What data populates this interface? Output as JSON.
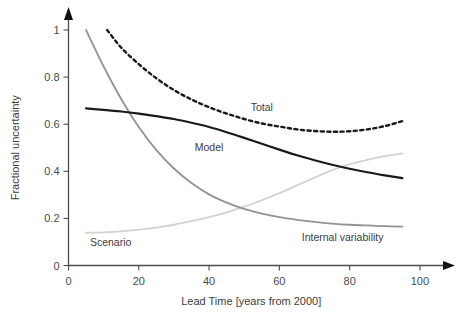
{
  "chart_data": {
    "type": "line",
    "title": "",
    "subtitle": "",
    "xlabel": "Lead Time [years from 2000]",
    "ylabel": "Fractional uncertainty",
    "xlim": [
      0,
      104
    ],
    "ylim": [
      0,
      1.08
    ],
    "grid": false,
    "legend_position": "inline-annotations",
    "xticks": [
      0,
      20,
      40,
      60,
      80,
      100
    ],
    "xtick_labels": [
      "0",
      "20",
      "40",
      "60",
      "80",
      "100"
    ],
    "yticks": [
      0,
      0.2,
      0.4,
      0.6,
      0.8,
      1
    ],
    "ytick_labels": [
      "0",
      "0.2",
      "0.4",
      "0.6",
      "0.8",
      "1"
    ],
    "x": [
      5,
      10,
      15,
      20,
      25,
      30,
      35,
      40,
      45,
      50,
      55,
      60,
      65,
      70,
      75,
      80,
      85,
      90,
      95
    ],
    "series": [
      {
        "name": "Total",
        "label": "Total",
        "color": "#1a1a1a",
        "style": "dashed",
        "width": 2.4,
        "x": [
          11,
          15,
          20,
          25,
          30,
          35,
          40,
          45,
          50,
          55,
          60,
          65,
          70,
          75,
          80,
          85,
          90,
          95
        ],
        "values": [
          1.0,
          0.925,
          0.855,
          0.795,
          0.745,
          0.705,
          0.672,
          0.645,
          0.622,
          0.603,
          0.59,
          0.578,
          0.571,
          0.568,
          0.57,
          0.578,
          0.592,
          0.613
        ],
        "label_x": 55,
        "label_y": 0.672
      },
      {
        "name": "Model",
        "label": "Model",
        "color": "#1a1a1a",
        "style": "solid",
        "width": 2.2,
        "x": [
          5,
          10,
          15,
          20,
          25,
          30,
          35,
          40,
          45,
          50,
          55,
          60,
          65,
          70,
          75,
          80,
          85,
          90,
          95
        ],
        "values": [
          0.667,
          0.661,
          0.654,
          0.645,
          0.634,
          0.622,
          0.606,
          0.588,
          0.566,
          0.542,
          0.517,
          0.492,
          0.468,
          0.447,
          0.428,
          0.411,
          0.396,
          0.383,
          0.371
        ],
        "label_x": 40,
        "label_y": 0.505
      },
      {
        "name": "Scenario",
        "label": "Scenario",
        "color": "#939393",
        "style": "solid",
        "width": 1.8,
        "x": [
          5,
          10,
          15,
          20,
          25,
          30,
          35,
          40,
          45,
          50,
          55,
          60,
          65,
          70,
          75,
          80,
          85,
          90,
          95
        ],
        "values": [
          1.0,
          0.845,
          0.707,
          0.588,
          0.49,
          0.412,
          0.35,
          0.302,
          0.267,
          0.24,
          0.22,
          0.205,
          0.194,
          0.185,
          0.178,
          0.173,
          0.17,
          0.167,
          0.165
        ],
        "label_x": 12,
        "label_y": 0.098
      },
      {
        "name": "Internal variability",
        "label": "Internal variability",
        "color": "#d2d2d2",
        "style": "solid",
        "width": 1.8,
        "x": [
          5,
          10,
          15,
          20,
          25,
          30,
          35,
          40,
          45,
          50,
          55,
          60,
          65,
          70,
          75,
          80,
          85,
          90,
          95
        ],
        "values": [
          0.139,
          0.141,
          0.145,
          0.152,
          0.161,
          0.173,
          0.188,
          0.205,
          0.226,
          0.25,
          0.277,
          0.307,
          0.34,
          0.373,
          0.405,
          0.43,
          0.449,
          0.464,
          0.476
        ],
        "label_x": 78,
        "label_y": 0.122
      }
    ]
  },
  "axes": {
    "x_axis_name": "x-axis",
    "y_axis_name": "y-axis",
    "arrow_x": "arrow-right",
    "arrow_y": "arrow-up"
  },
  "colors": {
    "axis": "#4d4d4d",
    "text": "#3c3c3c",
    "tick_text": "#4a4a4a",
    "background": "#ffffff",
    "total": "#1a1a1a",
    "model": "#1a1a1a",
    "scenario": "#939393",
    "internal_variability": "#d2d2d2"
  }
}
